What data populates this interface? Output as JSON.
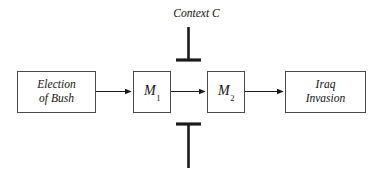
{
  "diagram": {
    "background_color": "#ffffff",
    "stroke_color": "#1a1a1a",
    "box_border_color": "#4a4a4a",
    "text_color": "#111111",
    "width": 377,
    "height": 186
  },
  "nodes": {
    "election": {
      "line1": "Election",
      "line2": "of Bush"
    },
    "m1": {
      "base": "M",
      "subscript": "1"
    },
    "m2": {
      "base": "M",
      "subscript": "2"
    },
    "iraq": {
      "line1": "Iraq",
      "line2": "Invasion"
    }
  },
  "moderator": {
    "label": "Context C",
    "top_connector_type": "inhibitory-bar-down",
    "bottom_connector_type": "inhibitory-bar-up"
  },
  "edges": [
    {
      "from": "election",
      "to": "m1",
      "type": "arrow"
    },
    {
      "from": "m1",
      "to": "m2",
      "type": "arrow"
    },
    {
      "from": "m2",
      "to": "iraq",
      "type": "arrow"
    }
  ]
}
